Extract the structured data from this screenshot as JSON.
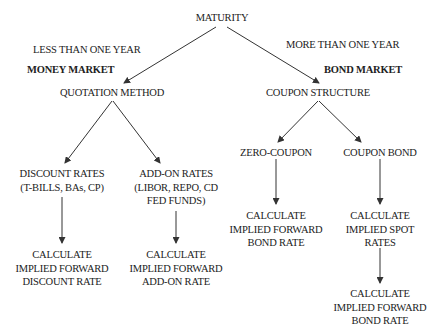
{
  "root": {
    "label": "MATURITY"
  },
  "branches": {
    "left": {
      "condition": "LESS THAN ONE YEAR",
      "market": "MONEY MARKET",
      "node": "QUOTATION METHOD",
      "children": [
        {
          "title": "DISCOUNT RATES",
          "subtitle": "(T-BILLS, BAs, CP)",
          "result": [
            "CALCULATE",
            "IMPLIED FORWARD",
            "DISCOUNT RATE"
          ]
        },
        {
          "title": "ADD-ON RATES",
          "subtitle": "(LIBOR, REPO, CD",
          "subtitle2": "FED FUNDS)",
          "result": [
            "CALCULATE",
            "IMPLIED FORWARD",
            "ADD-ON RATE"
          ]
        }
      ]
    },
    "right": {
      "condition": "MORE THAN ONE YEAR",
      "market": "BOND MARKET",
      "node": "COUPON STRUCTURE",
      "children": [
        {
          "title": "ZERO-COUPON",
          "result": [
            "CALCULATE",
            "IMPLIED FORWARD",
            "BOND RATE"
          ]
        },
        {
          "title": "COUPON BOND",
          "result": [
            "CALCULATE",
            "IMPLIED SPOT",
            "RATES"
          ],
          "result2": [
            "CALCULATE",
            "IMPLIED FORWARD",
            "BOND RATE"
          ]
        }
      ]
    }
  },
  "colors": {
    "line": "#333333",
    "text": "#222222",
    "background": "#ffffff"
  }
}
